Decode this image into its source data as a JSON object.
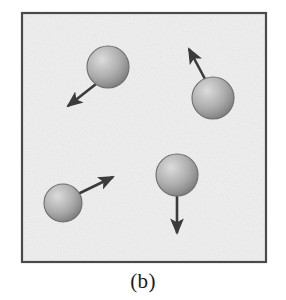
{
  "figure": {
    "caption": "(b)",
    "panel_label": "b",
    "colors": {
      "page_background": "#ffffff",
      "panel_background": "#efefef",
      "panel_border": "#4a4a4a",
      "sphere_highlight": "#d8d8d8",
      "sphere_midtone": "#a8a8a8",
      "sphere_edge": "#7a7a7a",
      "sphere_outline": "#6e6e6e",
      "arrow": "#3a3a3a",
      "caption_text": "#1a1a1a"
    },
    "panel": {
      "x": 21,
      "y": 12,
      "width": 246,
      "height": 251,
      "border_width": 2
    },
    "spheres": [
      {
        "id": "sphere-top-left",
        "cx": 108,
        "cy": 67,
        "r": 21,
        "arrow": {
          "id": "arrow-down-left",
          "direction": "down-left",
          "from_x": 96,
          "from_y": 84,
          "to_x": 68,
          "to_y": 106,
          "length": 36,
          "angle_deg": 218
        }
      },
      {
        "id": "sphere-right",
        "cx": 213,
        "cy": 98,
        "r": 21,
        "arrow": {
          "id": "arrow-up-left",
          "direction": "up-left",
          "from_x": 205,
          "from_y": 79,
          "to_x": 189,
          "to_y": 49,
          "length": 34,
          "angle_deg": 118
        }
      },
      {
        "id": "sphere-bottom-left",
        "cx": 63,
        "cy": 203,
        "r": 19,
        "arrow": {
          "id": "arrow-up-right",
          "direction": "up-right",
          "from_x": 78,
          "from_y": 194,
          "to_x": 113,
          "to_y": 177,
          "length": 39,
          "angle_deg": 26
        }
      },
      {
        "id": "sphere-bottom-middle",
        "cx": 177,
        "cy": 175,
        "r": 21,
        "arrow": {
          "id": "arrow-down",
          "direction": "down",
          "from_x": 177,
          "from_y": 196,
          "to_x": 177,
          "to_y": 233,
          "length": 37,
          "angle_deg": 270
        }
      }
    ]
  }
}
